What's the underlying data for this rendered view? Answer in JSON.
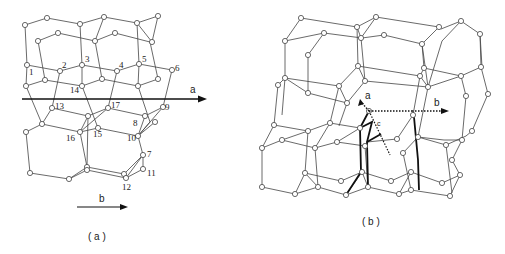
{
  "figure": {
    "panel_a": {
      "caption": "( a )",
      "axis_a_label": "a",
      "axis_b_label": "b",
      "node_labels": [
        "1",
        "2",
        "3",
        "4",
        "5",
        "6",
        "7",
        "8",
        "9",
        "10",
        "11",
        "12",
        "13",
        "14",
        "15",
        "16",
        "17"
      ]
    },
    "panel_b": {
      "caption": "( b )",
      "axis_a_label": "a",
      "axis_b_label": "b",
      "axis_c_label": "c"
    }
  }
}
